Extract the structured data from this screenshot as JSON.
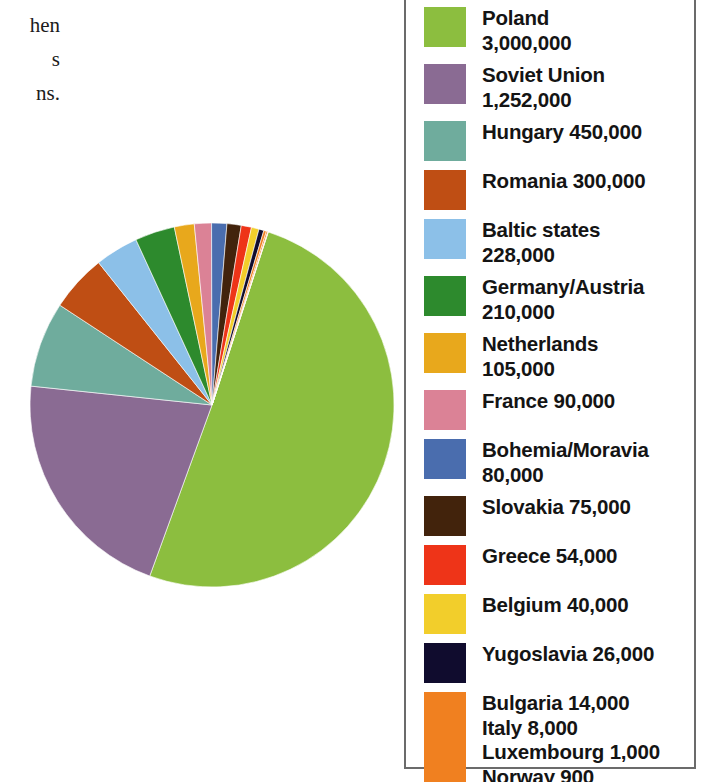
{
  "page": {
    "background_color": "#ffffff",
    "body_text_fragments": [
      "hen",
      "s",
      "ns."
    ]
  },
  "legend": {
    "border_color": "#6b6b6b",
    "background_color": "#ffffff",
    "entries": [
      {
        "label": "Poland",
        "value": "3,000,000",
        "text": "Poland\n3,000,000",
        "color": "#8CBE3F",
        "swatch": "tall:false"
      },
      {
        "label": "Soviet Union",
        "value": "1,252,000",
        "text": "Soviet Union\n1,252,000",
        "color": "#8A6B93",
        "swatch": "tall:false"
      },
      {
        "label": "Hungary",
        "value": "450,000",
        "text": "Hungary 450,000",
        "color": "#6FAC9D",
        "swatch": "tall:false"
      },
      {
        "label": "Romania",
        "value": "300,000",
        "text": "Romania 300,000",
        "color": "#BF4E14",
        "swatch": "tall:false"
      },
      {
        "label": "Baltic states",
        "value": "228,000",
        "text": "Baltic states\n228,000",
        "color": "#8CC0E8",
        "swatch": "tall:false"
      },
      {
        "label": "Germany/Austria",
        "value": "210,000",
        "text": "Germany/Austria\n210,000",
        "color": "#2D8A2D",
        "swatch": "tall:false"
      },
      {
        "label": "Netherlands",
        "value": "105,000",
        "text": "Netherlands\n105,000",
        "color": "#E8A81C",
        "swatch": "tall:false"
      },
      {
        "label": "France",
        "value": "90,000",
        "text": "France 90,000",
        "color": "#DB8296",
        "swatch": "tall:false"
      },
      {
        "label": "Bohemia/Moravia",
        "value": "80,000",
        "text": "Bohemia/Moravia\n80,000",
        "color": "#4A6DAE",
        "swatch": "tall:false"
      },
      {
        "label": "Slovakia",
        "value": "75,000",
        "text": "Slovakia 75,000",
        "color": "#42230C",
        "swatch": "tall:false"
      },
      {
        "label": "Greece",
        "value": "54,000",
        "text": "Greece 54,000",
        "color": "#EE3418",
        "swatch": "tall:false"
      },
      {
        "label": "Belgium",
        "value": "40,000",
        "text": "Belgium 40,000",
        "color": "#F2CE2B",
        "swatch": "tall:false"
      },
      {
        "label": "Yugoslavia",
        "value": "26,000",
        "text": "Yugoslavia 26,000",
        "color": "#100C2E",
        "swatch": "tall:false"
      },
      {
        "label": "Bulgaria / Italy / Luxembourg / Norway",
        "value": "14,000 / 8,000 / 1,000 / 900",
        "text": "Bulgaria 14,000\nItaly 8,000\nLuxembourg 1,000\nNorway 900",
        "color": "#F08020",
        "swatch": "tall:true"
      }
    ]
  },
  "chart_data": {
    "type": "pie",
    "title": "",
    "subtitle": "",
    "xlabel": "",
    "ylabel": "",
    "grid": false,
    "legend_position": "right",
    "units": "persons",
    "total": 5450900,
    "start_angle_deg": 0,
    "direction": "clockwise",
    "categories": [
      "Poland",
      "Soviet Union",
      "Hungary",
      "Romania",
      "Baltic states",
      "Germany/Austria",
      "Netherlands",
      "France",
      "Bohemia/Moravia",
      "Slovakia",
      "Greece",
      "Belgium",
      "Yugoslavia",
      "Bulgaria",
      "Italy",
      "Luxembourg",
      "Norway"
    ],
    "values": [
      3000000,
      1252000,
      450000,
      300000,
      228000,
      210000,
      105000,
      90000,
      80000,
      75000,
      54000,
      40000,
      26000,
      14000,
      8000,
      1000,
      900
    ],
    "colors": [
      "#8CBE3F",
      "#8A6B93",
      "#6FAC9D",
      "#BF4E14",
      "#8CC0E8",
      "#2D8A2D",
      "#E8A81C",
      "#DB8296",
      "#4A6DAE",
      "#42230C",
      "#EE3418",
      "#F2CE2B",
      "#100C2E",
      "#F08020",
      "#F08020",
      "#F08020",
      "#F08020"
    ],
    "slice_labels": [
      "Poland 3,000,000",
      "Soviet Union 1,252,000",
      "Hungary 450,000",
      "Romania 300,000",
      "Baltic states 228,000",
      "Germany/Austria 210,000",
      "Netherlands 105,000",
      "France 90,000",
      "Bohemia/Moravia 80,000",
      "Slovakia 75,000",
      "Greece 54,000",
      "Belgium 40,000",
      "Yugoslavia 26,000",
      "Bulgaria 14,000",
      "Italy 8,000",
      "Luxembourg 1,000",
      "Norway 900"
    ]
  }
}
